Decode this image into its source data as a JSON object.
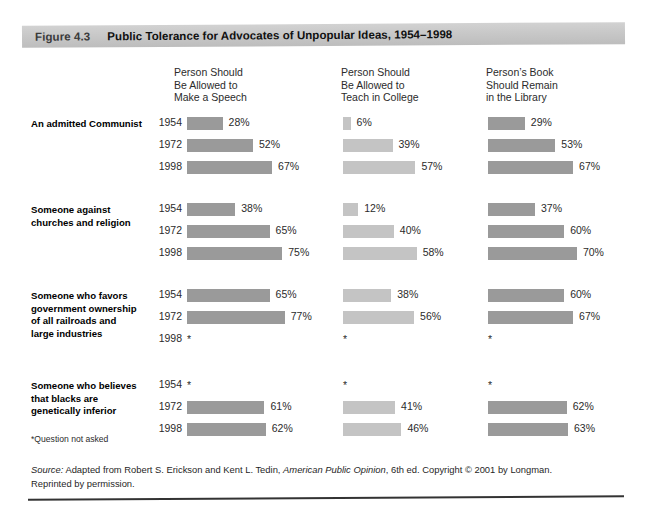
{
  "figure": {
    "number": "Figure 4.3",
    "title": "Public Tolerance for Advocates of Unpopular Ideas, 1954–1998"
  },
  "footnote": "*Question not asked",
  "source": {
    "label": "Source:",
    "text_before_title": " Adapted from Robert S. Erickson and Kent L. Tedin, ",
    "book_title": "American Public Opinion",
    "text_after_title": ", 6th ed. Copyright © 2001 by Longman. Reprinted by permission."
  },
  "chart_data": {
    "type": "bar",
    "title": "Public Tolerance for Advocates of Unpopular Ideas, 1954–1998",
    "xlabel": "",
    "ylabel": "",
    "xlim": [
      0,
      100
    ],
    "grid": false,
    "legend": "none",
    "orientation": "horizontal",
    "value_suffix": "%",
    "missing_marker": "*",
    "missing_note": "Question not asked",
    "columns": [
      {
        "label": "Person Should\nBe Allowed to\nMake a Speech",
        "color": "#9a9a9a"
      },
      {
        "label": "Person Should\nBe Allowed to\nTeach in College",
        "color": "#c4c4c4"
      },
      {
        "label": "Person’s Book\nShould Remain\nin the Library",
        "color": "#9a9a9a"
      }
    ],
    "years": [
      "1954",
      "1972",
      "1998"
    ],
    "groups": [
      {
        "label": "An admitted Communist",
        "values": [
          [
            28,
            52,
            67
          ],
          [
            6,
            39,
            57
          ],
          [
            29,
            53,
            67
          ]
        ]
      },
      {
        "label": "Someone against\nchurches and religion",
        "values": [
          [
            38,
            65,
            75
          ],
          [
            12,
            40,
            58
          ],
          [
            37,
            60,
            70
          ]
        ]
      },
      {
        "label": "Someone who favors\ngovernment ownership\nof all railroads and\nlarge industries",
        "values": [
          [
            65,
            77,
            null
          ],
          [
            38,
            56,
            null
          ],
          [
            60,
            67,
            null
          ]
        ]
      },
      {
        "label": "Someone who believes\nthat blacks are\ngenetically inferior",
        "values": [
          [
            null,
            61,
            62
          ],
          [
            null,
            41,
            46
          ],
          [
            null,
            62,
            63
          ]
        ]
      }
    ]
  }
}
